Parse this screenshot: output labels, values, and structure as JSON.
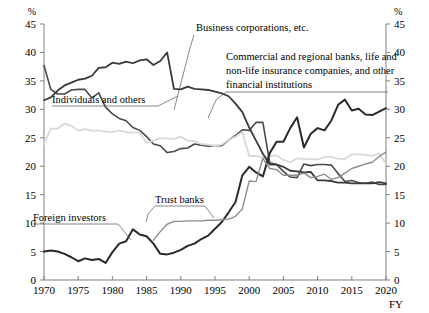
{
  "chart_data": {
    "type": "line",
    "title": "",
    "xlabel": "FY",
    "ylabel": "%",
    "y_unit_left": "%",
    "y_unit_right": "%",
    "xlim": [
      1970,
      2020
    ],
    "ylim": [
      0,
      45
    ],
    "grid": false,
    "legend_position": "inline-annotations",
    "x_ticks": [
      1970,
      1975,
      1980,
      1985,
      1990,
      1995,
      2000,
      2005,
      2010,
      2015,
      2020
    ],
    "y_ticks": [
      0,
      5,
      10,
      15,
      20,
      25,
      30,
      35,
      40,
      45
    ],
    "x": [
      1970,
      1971,
      1972,
      1973,
      1974,
      1975,
      1976,
      1977,
      1978,
      1979,
      1980,
      1981,
      1982,
      1983,
      1984,
      1985,
      1986,
      1987,
      1988,
      1989,
      1990,
      1991,
      1992,
      1993,
      1994,
      1995,
      1996,
      1997,
      1998,
      1999,
      2000,
      2001,
      2002,
      2003,
      2004,
      2005,
      2006,
      2007,
      2008,
      2009,
      2010,
      2011,
      2012,
      2013,
      2014,
      2015,
      2016,
      2017,
      2018,
      2019,
      2020
    ],
    "series": [
      {
        "name": "Individuals and others",
        "color": "#4a4a4a",
        "width": 1.6,
        "values": [
          37.7,
          33.5,
          32.7,
          32.7,
          33.4,
          33.5,
          33.5,
          32.0,
          32.9,
          30.4,
          29.2,
          28.4,
          28.0,
          26.8,
          26.3,
          25.2,
          23.9,
          23.6,
          22.4,
          22.6,
          23.1,
          23.2,
          23.9,
          23.7,
          23.5,
          23.6,
          23.6,
          24.6,
          25.4,
          26.4,
          26.3,
          27.7,
          27.7,
          20.6,
          20.3,
          19.1,
          18.1,
          18.0,
          20.4,
          20.1,
          20.3,
          20.3,
          20.2,
          18.7,
          17.3,
          17.5,
          17.1,
          17.0,
          17.2,
          16.8,
          16.8
        ]
      },
      {
        "name": "Business corporations, etc.",
        "color": "#d9d9d9",
        "width": 1.8,
        "values": [
          23.9,
          26.6,
          26.6,
          27.5,
          27.1,
          26.3,
          26.5,
          26.2,
          26.3,
          26.1,
          26.0,
          26.3,
          26.0,
          25.9,
          25.9,
          24.1,
          24.5,
          24.9,
          24.9,
          24.8,
          25.2,
          24.5,
          24.4,
          23.9,
          23.8,
          23.6,
          23.8,
          24.6,
          25.2,
          26.0,
          21.8,
          21.8,
          21.5,
          21.8,
          21.9,
          21.1,
          20.7,
          21.4,
          21.3,
          21.2,
          21.2,
          21.6,
          21.7,
          21.3,
          21.3,
          22.1,
          22.1,
          22.0,
          21.8,
          22.3,
          20.4
        ]
      },
      {
        "name": "Commercial and regional banks, life and non-life insurance companies, and other financial institutions",
        "color": "#3a3a3a",
        "width": 1.8,
        "values": [
          31.6,
          32.1,
          33.3,
          34.2,
          34.7,
          35.2,
          35.4,
          35.9,
          37.3,
          37.4,
          38.2,
          38.0,
          38.4,
          38.1,
          38.6,
          38.8,
          37.8,
          38.5,
          40.0,
          33.6,
          33.5,
          34.0,
          33.6,
          33.5,
          33.4,
          33.1,
          32.8,
          32.3,
          31.0,
          29.5,
          26.8,
          24.5,
          22.2,
          20.3,
          20.3,
          19.9,
          19.2,
          19.1,
          18.9,
          19.0,
          17.5,
          17.5,
          17.4,
          17.1,
          17.1,
          17.0,
          17.0,
          17.0,
          17.0,
          17.2,
          17.0
        ]
      },
      {
        "name": "Foreign investors",
        "color": "#2a2a2a",
        "width": 2.0,
        "values": [
          5.0,
          5.2,
          5.0,
          4.6,
          4.0,
          3.3,
          3.8,
          3.5,
          3.7,
          3.0,
          4.9,
          6.4,
          6.8,
          8.9,
          8.0,
          7.7,
          6.4,
          4.6,
          4.5,
          4.8,
          5.3,
          6.0,
          6.4,
          7.2,
          7.8,
          9.0,
          10.2,
          11.9,
          13.7,
          18.4,
          19.9,
          18.9,
          18.2,
          22.3,
          24.3,
          24.3,
          26.7,
          28.6,
          23.3,
          25.7,
          26.7,
          26.3,
          28.0,
          30.8,
          31.7,
          29.8,
          30.1,
          29.1,
          29.0,
          29.6,
          30.2
        ]
      },
      {
        "name": "Trust banks",
        "color": "#8c8c8c",
        "width": 1.4,
        "values": [
          null,
          null,
          null,
          null,
          null,
          null,
          null,
          null,
          null,
          null,
          null,
          null,
          null,
          null,
          null,
          null,
          7.0,
          8.5,
          9.8,
          10.3,
          10.3,
          10.4,
          10.4,
          10.4,
          10.5,
          10.5,
          10.6,
          10.7,
          11.2,
          12.5,
          17.4,
          17.3,
          21.4,
          19.6,
          19.4,
          18.4,
          18.4,
          18.4,
          18.8,
          18.0,
          18.2,
          18.6,
          17.7,
          18.0,
          18.8,
          19.6,
          20.0,
          20.4,
          20.7,
          21.7,
          22.5
        ]
      }
    ],
    "annotations": [
      {
        "name": "individuals-label",
        "text": "Individuals and others"
      },
      {
        "name": "business-label",
        "text": "Business corporations, etc."
      },
      {
        "name": "financial-label-1",
        "text": "Commercial and regional banks, life and"
      },
      {
        "name": "financial-label-2",
        "text": "non-life insurance companies, and other"
      },
      {
        "name": "financial-label-3",
        "text": "financial institutions"
      },
      {
        "name": "foreign-label",
        "text": "Foreign investors"
      },
      {
        "name": "trust-label",
        "text": "Trust banks"
      }
    ]
  }
}
